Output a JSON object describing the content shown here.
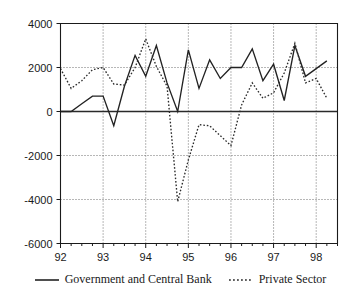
{
  "chart_data": {
    "type": "line",
    "title": "",
    "xlabel": "",
    "ylabel": "",
    "xlim": [
      92.0,
      98.5
    ],
    "ylim": [
      -6000,
      4000
    ],
    "ytick_values": [
      4000,
      2000,
      0,
      -2000,
      -4000,
      -6000
    ],
    "ytick_labels": [
      "4000",
      "2000",
      "0",
      "-2000",
      "-4000",
      "-6000"
    ],
    "xtick_values": [
      92,
      93,
      94,
      95,
      96,
      97,
      98
    ],
    "xtick_labels": [
      "92",
      "93",
      "94",
      "95",
      "96",
      "97",
      "98"
    ],
    "minor_ticks_per_year": 4,
    "grid": true,
    "grid_style": "dotted",
    "legend_position": "bottom-center",
    "zero_line": true,
    "x": [
      92.0,
      92.25,
      92.5,
      92.75,
      93.0,
      93.25,
      93.5,
      93.75,
      94.0,
      94.25,
      94.5,
      94.75,
      95.0,
      95.25,
      95.5,
      95.75,
      96.0,
      96.25,
      96.5,
      96.75,
      97.0,
      97.25,
      97.5,
      97.75,
      98.0,
      98.25
    ],
    "series": [
      {
        "name": "Government and Central Bank",
        "style": "solid",
        "color": "#222222",
        "values": [
          0,
          0,
          350,
          700,
          700,
          -650,
          1150,
          2550,
          1600,
          3000,
          1300,
          0,
          2800,
          1050,
          2350,
          1500,
          2000,
          2000,
          2850,
          1400,
          2150,
          500,
          3000,
          1600,
          1950,
          2300
        ]
      },
      {
        "name": "Private Sector",
        "style": "dotted",
        "color": "#2b2b2b",
        "values": [
          1950,
          1050,
          1400,
          1900,
          2000,
          1250,
          1200,
          2000,
          3300,
          2050,
          1150,
          -4100,
          -2200,
          -600,
          -650,
          -1100,
          -1550,
          300,
          1300,
          600,
          850,
          1750,
          3100,
          1300,
          1500,
          600
        ]
      }
    ]
  },
  "legend": {
    "entries": [
      {
        "label": "Government and Central Bank",
        "style": "solid"
      },
      {
        "label": "Private Sector",
        "style": "dotted"
      }
    ]
  }
}
